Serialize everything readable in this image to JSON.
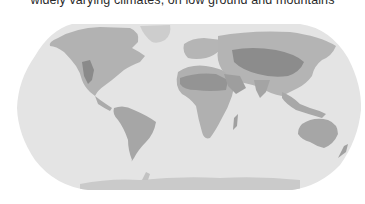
{
  "caption": {
    "text": "widely varying climates, on low ground and mountains"
  },
  "map": {
    "projection": "Robinson",
    "style": "grayscale printed climate map",
    "colors": {
      "ocean": "#e4e4e4",
      "land_light": "#c4c4c4",
      "land_mid": "#a9a9a9",
      "land_dark": "#8e8e8e",
      "ice": "#cfcfcf",
      "background": "#ffffff"
    },
    "regions": [
      "North America",
      "South America",
      "Greenland",
      "Europe",
      "Africa",
      "Asia",
      "Arabian Peninsula",
      "India",
      "Southeast Asia",
      "Australia",
      "New Zealand",
      "Madagascar",
      "Antarctica"
    ]
  }
}
